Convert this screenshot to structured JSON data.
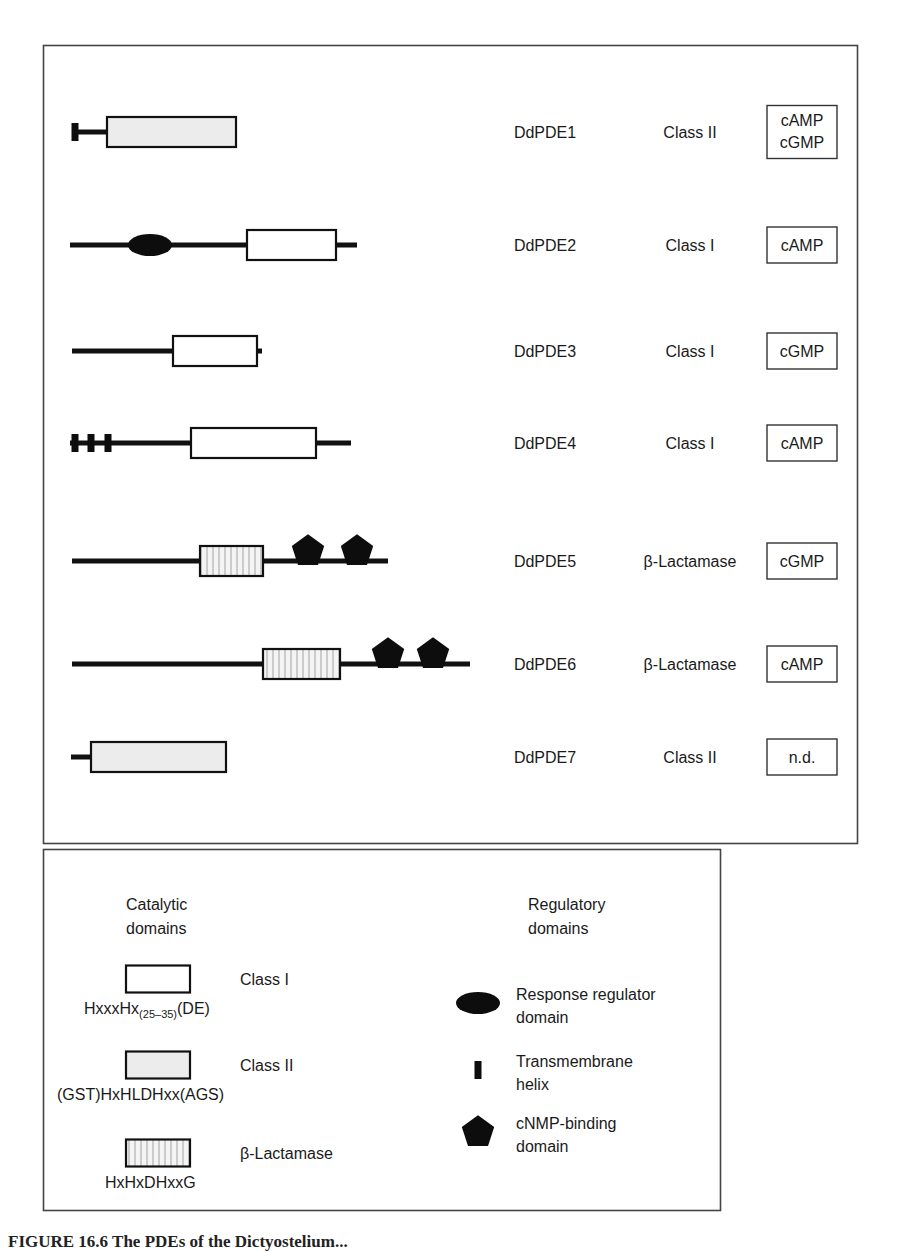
{
  "figure": {
    "colors": {
      "line": "#111111",
      "frame": "#444444",
      "class1_fill": "#ffffff",
      "class2_fill": "#ececec",
      "beta_lactamase_fill": "vertical-stripes",
      "regulatory_fill": "#0d0d0d"
    },
    "proteins": [
      {
        "name": "DdPDE1",
        "class": "Class II",
        "substrate": [
          "cAMP",
          "cGMP"
        ],
        "y": 132,
        "backbone": [
          74,
          107
        ],
        "catalytic": {
          "type": "class2",
          "x1": 107,
          "x2": 236
        },
        "regulatory": [
          {
            "type": "tm-helix",
            "x": 75
          }
        ]
      },
      {
        "name": "DdPDE2",
        "class": "Class I",
        "substrate": [
          "cAMP"
        ],
        "y": 245,
        "backbone": [
          70,
          357
        ],
        "catalytic": {
          "type": "class1",
          "x1": 247,
          "x2": 336
        },
        "regulatory": [
          {
            "type": "response-regulator",
            "x": 150
          }
        ]
      },
      {
        "name": "DdPDE3",
        "class": "Class I",
        "substrate": [
          "cGMP"
        ],
        "y": 351,
        "backbone": [
          72,
          262
        ],
        "catalytic": {
          "type": "class1",
          "x1": 173,
          "x2": 257
        },
        "regulatory": []
      },
      {
        "name": "DdPDE4",
        "class": "Class I",
        "substrate": [
          "cAMP"
        ],
        "y": 443,
        "backbone": [
          70,
          351
        ],
        "catalytic": {
          "type": "class1",
          "x1": 191,
          "x2": 316
        },
        "regulatory": [
          {
            "type": "tm-helix",
            "x": 75
          },
          {
            "type": "tm-helix",
            "x": 91
          },
          {
            "type": "tm-helix",
            "x": 108
          }
        ]
      },
      {
        "name": "DdPDE5",
        "class": "β-Lactamase",
        "substrate": [
          "cGMP"
        ],
        "y": 561,
        "backbone": [
          72,
          388
        ],
        "catalytic": {
          "type": "beta-lactamase",
          "x1": 200,
          "x2": 263
        },
        "regulatory": [
          {
            "type": "cnmp-binding",
            "x": 308
          },
          {
            "type": "cnmp-binding",
            "x": 357
          }
        ]
      },
      {
        "name": "DdPDE6",
        "class": "β-Lactamase",
        "substrate": [
          "cAMP"
        ],
        "y": 664,
        "backbone": [
          72,
          470
        ],
        "catalytic": {
          "type": "beta-lactamase",
          "x1": 263,
          "x2": 340
        },
        "regulatory": [
          {
            "type": "cnmp-binding",
            "x": 388
          },
          {
            "type": "cnmp-binding",
            "x": 433
          }
        ]
      },
      {
        "name": "DdPDE7",
        "class": "Class II",
        "substrate": [
          "n.d."
        ],
        "y": 757,
        "backbone": [
          71,
          91
        ],
        "catalytic": {
          "type": "class2",
          "x1": 91,
          "x2": 226
        },
        "regulatory": []
      }
    ],
    "legend": {
      "catalytic_title": [
        "Catalytic",
        "domains"
      ],
      "regulatory_title": [
        "Regulatory",
        "domains"
      ],
      "catalytic": [
        {
          "type": "class1",
          "label": "Class I",
          "motif_main": "HxxxHx",
          "motif_sub": "(25–35)",
          "motif_tail": "(DE)"
        },
        {
          "type": "class2",
          "label": "Class II",
          "motif_main": "(GST)HxHLDHxx(AGS)",
          "motif_sub": "",
          "motif_tail": ""
        },
        {
          "type": "beta-lactamase",
          "label": "β-Lactamase",
          "motif_main": "HxHxDHxxG",
          "motif_sub": "",
          "motif_tail": ""
        }
      ],
      "regulatory": [
        {
          "type": "response-regulator",
          "label": [
            "Response regulator",
            "domain"
          ]
        },
        {
          "type": "tm-helix",
          "label": [
            "Transmembrane",
            "helix"
          ]
        },
        {
          "type": "cnmp-binding",
          "label": [
            "cNMP-binding",
            "domain"
          ]
        }
      ]
    },
    "caption_fragment": "FIGURE 16.6 The PDEs of the Dictyostelium..."
  }
}
